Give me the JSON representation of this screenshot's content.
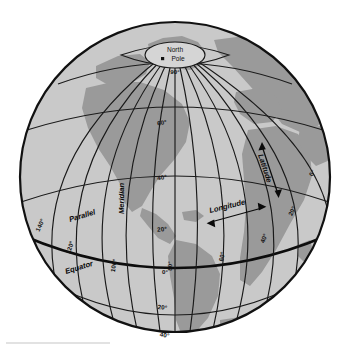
{
  "diagram": {
    "type": "orthographic-globe",
    "projection_center": {
      "lat": 10,
      "lon": -55
    },
    "colors": {
      "background": "#ffffff",
      "ocean": "#c9c9c9",
      "land": "#9a9a9a",
      "grid": "#1a1a1a",
      "equator": "#0d0d0d",
      "pole_cap": "#d5d5d5",
      "text": "#111111"
    },
    "pole": {
      "label_line1": "North",
      "label_line2": "Pole",
      "marker": "pole-dot"
    },
    "annotations": [
      {
        "id": "meridian",
        "text": "Meridian",
        "style": "bold-italic",
        "rotation": -90
      },
      {
        "id": "parallel",
        "text": "Parallel",
        "style": "bold-italic",
        "rotation": -18
      },
      {
        "id": "equator",
        "text": "Equator",
        "style": "bold-italic",
        "rotation": -18
      },
      {
        "id": "latitude",
        "text": "Latitude",
        "style": "bold-italic",
        "rotation": 72,
        "arrow": "double"
      },
      {
        "id": "longitude",
        "text": "Longitude",
        "style": "bold-italic",
        "rotation": -14,
        "arrow": "double"
      }
    ],
    "latitude_labels": [
      {
        "value": "90°",
        "hemisphere": "north"
      },
      {
        "value": "60°",
        "hemisphere": "north"
      },
      {
        "value": "40°",
        "hemisphere": "north"
      },
      {
        "value": "20°",
        "hemisphere": "north"
      },
      {
        "value": "0°",
        "hemisphere": "equator"
      },
      {
        "value": "20°",
        "hemisphere": "south"
      },
      {
        "value": "40°",
        "hemisphere": "south"
      }
    ],
    "longitude_labels": [
      {
        "value": "140°",
        "side": "left"
      },
      {
        "value": "120°",
        "side": "left"
      },
      {
        "value": "100°",
        "side": "left"
      },
      {
        "value": "80°",
        "side": "center"
      },
      {
        "value": "60°",
        "side": "right"
      },
      {
        "value": "40°",
        "side": "right"
      },
      {
        "value": "20°",
        "side": "right"
      },
      {
        "value": "0°",
        "side": "right"
      }
    ],
    "grid": {
      "parallel_step_deg": 20,
      "meridian_step_deg": 20,
      "equator_emphasized": true
    }
  }
}
